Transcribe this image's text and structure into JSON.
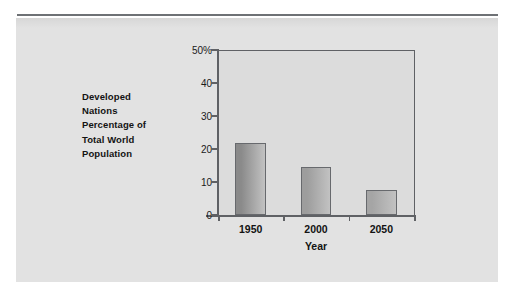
{
  "figure": {
    "background_color": "#e2e2e2",
    "plot_background_color": "#dcdcdc",
    "axis_color": "#5f6165"
  },
  "chart_data": {
    "type": "bar",
    "title": "",
    "categories": [
      "1950",
      "2000",
      "2050"
    ],
    "values": [
      21.8,
      14.5,
      7.6
    ],
    "xlabel": "Year",
    "ylabel": "Developed Nations Percentage of Total World Population",
    "ylabel_lines": [
      "Developed",
      "Nations",
      "Percentage of",
      "Total World",
      "Population"
    ],
    "ylim": [
      0,
      50
    ],
    "ytick_values": [
      0,
      10,
      20,
      30,
      40,
      50
    ],
    "ytick_labels": [
      "0",
      "10",
      "20",
      "30",
      "40",
      "50%"
    ],
    "grid": false,
    "legend": false,
    "bar_colors": [
      "#8a8a8a",
      "#9d9d9d",
      "#a5a5a5"
    ],
    "bar_edge_color": "#67696d"
  }
}
